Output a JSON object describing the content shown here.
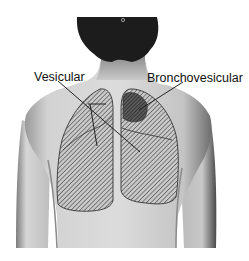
{
  "figure": {
    "labels": {
      "vesicular": "Vesicular",
      "bronchovesicular": "Bronchovesicular"
    },
    "colors": {
      "background": "#ffffff",
      "hair": "#1c1c1c",
      "skin_light": "#d8d8d8",
      "skin_mid": "#bdbdbd",
      "skin_shadow": "#7a7a7a",
      "hatch": "#3a3a3a",
      "bronchovesicular_fill": "#4a4a4a"
    }
  }
}
